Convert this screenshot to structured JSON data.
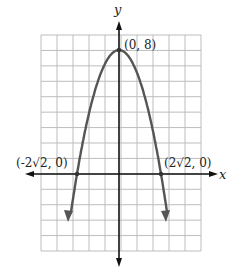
{
  "chart_data": {
    "type": "line",
    "title": "",
    "function": "y = 8 - x^2",
    "xlabel": "x",
    "ylabel": "y",
    "grid": true,
    "grid_columns": 10,
    "grid_rows": 14,
    "x_range_units": [
      -5,
      5
    ],
    "y_range_units": [
      -5,
      9
    ],
    "series": [
      {
        "name": "parabola",
        "x": [
          -3.2,
          -2.828,
          -2,
          -1,
          0,
          1,
          2,
          2.828,
          3.2
        ],
        "y": [
          -2.24,
          0,
          4,
          7,
          8,
          7,
          4,
          0,
          -2.24
        ]
      }
    ],
    "points": [
      {
        "label": "(0, 8)",
        "x": 0,
        "y": 8
      },
      {
        "label": "(-2√2, 0)",
        "x": -2.828,
        "y": 0
      },
      {
        "label": "(2√2, 0)",
        "x": 2.828,
        "y": 0
      }
    ],
    "colors": {
      "curve": "#555555",
      "axis": "#111111",
      "grid": "#bdbdbd"
    }
  },
  "labels": {
    "x_axis": "x",
    "y_axis": "y",
    "vertex": "(0, 8)",
    "left_intercept": "(-2√2, 0)",
    "right_intercept": "(2√2, 0)"
  }
}
